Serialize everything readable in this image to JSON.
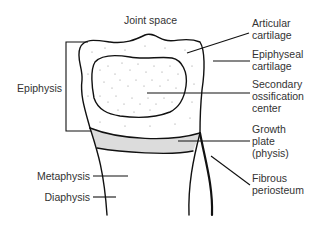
{
  "diagram": {
    "type": "anatomical-illustration",
    "colors": {
      "line": "#111111",
      "text": "#333333",
      "growth_plate_fill": "#dcdcdc",
      "stipple": "#777777",
      "background": "#ffffff"
    },
    "labels": {
      "joint_space": "Joint space",
      "articular_cartilage": [
        "Articular",
        "cartilage"
      ],
      "epiphyseal_cartilage": [
        "Epiphyseal",
        "cartilage"
      ],
      "secondary_ossification_center": [
        "Secondary",
        "ossification",
        "center"
      ],
      "growth_plate": [
        "Growth",
        "plate",
        "(physis)"
      ],
      "fibrous_periosteum": [
        "Fibrous",
        "periosteum"
      ],
      "epiphysis": "Epiphysis",
      "metaphysis": "Metaphysis",
      "diaphysis": "Diaphysis"
    }
  }
}
